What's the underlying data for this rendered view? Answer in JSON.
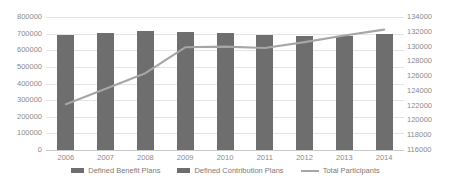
{
  "chart_data": {
    "type": "bar",
    "title": "",
    "xlabel": "",
    "ylabel": "",
    "grid": true,
    "legend_position": "bottom",
    "categories": [
      "2006",
      "2007",
      "2008",
      "2009",
      "2010",
      "2011",
      "2012",
      "2013",
      "2014"
    ],
    "axes": {
      "left": {
        "ylim": [
          0,
          800000
        ],
        "step": 100000,
        "ticks": [
          "800000",
          "700000",
          "600000",
          "500000",
          "400000",
          "300000",
          "200000",
          "100000",
          "0"
        ]
      },
      "right": {
        "ylim": [
          116000,
          134000
        ],
        "step": 2000,
        "ticks": [
          "134000",
          "132000",
          "130000",
          "128000",
          "126000",
          "124000",
          "122000",
          "120000",
          "118000",
          "116000"
        ]
      }
    },
    "series": [
      {
        "name": "Defined Benefit Plans",
        "type": "bar",
        "axis": "left",
        "color": "#6e6e6e",
        "values": [
          694000,
          706000,
          715000,
          707000,
          701000,
          692000,
          683000,
          686000,
          696000
        ]
      },
      {
        "name": "Defined Contribution Plans",
        "type": "bar",
        "axis": "left",
        "color": "#6e6e6e",
        "values": [
          0,
          0,
          0,
          0,
          0,
          0,
          0,
          0,
          0
        ]
      },
      {
        "name": "Total Participants",
        "type": "line",
        "axis": "right",
        "color": "#a6a6a6",
        "values": [
          122200,
          124300,
          126400,
          129900,
          130000,
          129800,
          130600,
          131500,
          132300
        ]
      }
    ]
  },
  "legend": {
    "items": [
      {
        "label": "Defined Benefit Plans",
        "marker": "bar-swatch"
      },
      {
        "label": "Defined Contribution Plans",
        "marker": "bar-swatch"
      },
      {
        "label": "Total Participants",
        "marker": "line-swatch"
      }
    ]
  }
}
